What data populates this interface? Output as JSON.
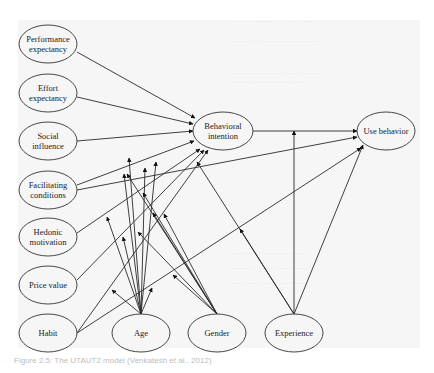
{
  "diagram": {
    "title": "UTAUT2 model",
    "nodes": [
      {
        "id": "pe",
        "lines": [
          "Performance",
          "expectancy"
        ],
        "cx": 48,
        "cy": 44,
        "rx": 29,
        "ry": 19
      },
      {
        "id": "ee",
        "lines": [
          "Effort",
          "expectancy"
        ],
        "cx": 48,
        "cy": 93,
        "rx": 29,
        "ry": 19
      },
      {
        "id": "si",
        "lines": [
          "Social",
          "influence"
        ],
        "cx": 48,
        "cy": 141,
        "rx": 29,
        "ry": 19
      },
      {
        "id": "fc",
        "lines": [
          "Facilitating",
          "conditions"
        ],
        "cx": 48,
        "cy": 190,
        "rx": 29,
        "ry": 19
      },
      {
        "id": "hm",
        "lines": [
          "Hedonic",
          "motivation"
        ],
        "cx": 48,
        "cy": 237,
        "rx": 29,
        "ry": 19
      },
      {
        "id": "pv",
        "lines": [
          "Price value"
        ],
        "cx": 48,
        "cy": 285,
        "rx": 29,
        "ry": 19
      },
      {
        "id": "habit",
        "lines": [
          "Habit"
        ],
        "cx": 48,
        "cy": 333,
        "rx": 29,
        "ry": 19
      },
      {
        "id": "age",
        "lines": [
          "Age"
        ],
        "cx": 141,
        "cy": 333,
        "rx": 29,
        "ry": 19
      },
      {
        "id": "gender",
        "lines": [
          "Gender"
        ],
        "cx": 217,
        "cy": 333,
        "rx": 29,
        "ry": 19
      },
      {
        "id": "exp",
        "lines": [
          "Experience"
        ],
        "cx": 294,
        "cy": 333,
        "rx": 29,
        "ry": 19
      },
      {
        "id": "bi",
        "lines": [
          "Behavioral",
          "intention"
        ],
        "cx": 223,
        "cy": 131,
        "rx": 30,
        "ry": 19
      },
      {
        "id": "ub",
        "lines": [
          "Use behavior"
        ],
        "cx": 386,
        "cy": 131,
        "rx": 29,
        "ry": 19
      }
    ],
    "edges": [
      {
        "from": [
          77,
          52
        ],
        "to": [
          195,
          118
        ],
        "type": "direct"
      },
      {
        "from": [
          77,
          97
        ],
        "to": [
          193,
          124
        ],
        "type": "direct"
      },
      {
        "from": [
          77,
          141
        ],
        "to": [
          193,
          131
        ],
        "type": "direct"
      },
      {
        "from": [
          77,
          185
        ],
        "to": [
          194,
          141
        ],
        "type": "direct"
      },
      {
        "from": [
          77,
          190
        ],
        "to": [
          357,
          137
        ],
        "type": "direct"
      },
      {
        "from": [
          77,
          233
        ],
        "to": [
          200,
          149
        ],
        "type": "direct"
      },
      {
        "from": [
          77,
          280
        ],
        "to": [
          204,
          150
        ],
        "type": "direct"
      },
      {
        "from": [
          77,
          333
        ],
        "to": [
          208,
          150
        ],
        "type": "direct"
      },
      {
        "from": [
          77,
          333
        ],
        "to": [
          361,
          148
        ],
        "type": "direct"
      },
      {
        "from": [
          253,
          131
        ],
        "to": [
          357,
          131
        ],
        "type": "direct"
      },
      {
        "from": [
          141,
          314
        ],
        "to": [
          124,
          174
        ],
        "type": "moderator"
      },
      {
        "from": [
          141,
          314
        ],
        "to": [
          145,
          168
        ],
        "type": "moderator"
      },
      {
        "from": [
          141,
          314
        ],
        "to": [
          156,
          162
        ],
        "type": "moderator"
      },
      {
        "from": [
          141,
          314
        ],
        "to": [
          107,
          217
        ],
        "type": "moderator"
      },
      {
        "from": [
          141,
          314
        ],
        "to": [
          123,
          237
        ],
        "type": "moderator"
      },
      {
        "from": [
          141,
          314
        ],
        "to": [
          112,
          290
        ],
        "type": "moderator"
      },
      {
        "from": [
          141,
          314
        ],
        "to": [
          152,
          288
        ],
        "type": "moderator"
      },
      {
        "from": [
          141,
          314
        ],
        "to": [
          129,
          158
        ],
        "type": "moderator"
      },
      {
        "from": [
          217,
          314
        ],
        "to": [
          127,
          174
        ],
        "type": "moderator"
      },
      {
        "from": [
          217,
          314
        ],
        "to": [
          143,
          193
        ],
        "type": "moderator"
      },
      {
        "from": [
          217,
          314
        ],
        "to": [
          153,
          213
        ],
        "type": "moderator"
      },
      {
        "from": [
          217,
          314
        ],
        "to": [
          164,
          214
        ],
        "type": "moderator"
      },
      {
        "from": [
          217,
          314
        ],
        "to": [
          138,
          232
        ],
        "type": "moderator"
      },
      {
        "from": [
          217,
          314
        ],
        "to": [
          173,
          275
        ],
        "type": "moderator"
      },
      {
        "from": [
          294,
          314
        ],
        "to": [
          197,
          162
        ],
        "type": "moderator"
      },
      {
        "from": [
          294,
          314
        ],
        "to": [
          240,
          229
        ],
        "type": "moderator"
      },
      {
        "from": [
          294,
          314
        ],
        "to": [
          294,
          131
        ],
        "type": "moderator"
      },
      {
        "from": [
          294,
          314
        ],
        "to": [
          363,
          145
        ],
        "type": "moderator"
      }
    ]
  },
  "caption": "Figure 2.5: The UTAUT2 model (Venkatesh et al., 2012)"
}
